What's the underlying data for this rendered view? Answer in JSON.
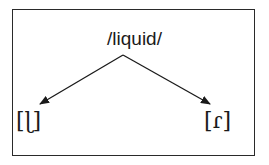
{
  "diagram": {
    "root": {
      "label": "/liquid/"
    },
    "leaves": [
      {
        "label": "[ɭ]"
      },
      {
        "label": "[ɾ]"
      }
    ],
    "edges": [
      {
        "from": "/liquid/",
        "to": "[ɭ]"
      },
      {
        "from": "/liquid/",
        "to": "[ɾ]"
      }
    ],
    "colors": {
      "line": "#1a1a1a",
      "background": "#ffffff"
    }
  }
}
